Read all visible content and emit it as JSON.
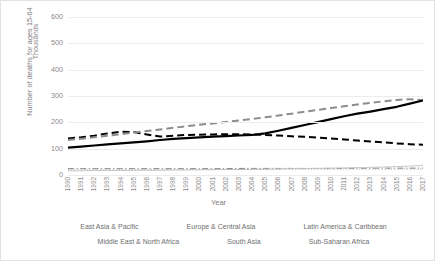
{
  "chart_data": {
    "type": "line",
    "title": "",
    "xlabel": "Year",
    "ylabel": "Number of deaths for ages 15-64",
    "yunit": "Thousands",
    "ylim": [
      0,
      600
    ],
    "yticks": [
      0,
      100,
      200,
      300,
      400,
      500,
      600
    ],
    "grid": true,
    "legend_position": "bottom",
    "x": [
      1990,
      1991,
      1992,
      1993,
      1994,
      1995,
      1996,
      1997,
      1998,
      1999,
      2000,
      2001,
      2002,
      2003,
      2004,
      2005,
      2006,
      2007,
      2008,
      2009,
      2010,
      2011,
      2012,
      2013,
      2014,
      2015,
      2016,
      2017
    ],
    "categories": [
      "1990",
      "1991",
      "1992",
      "1993",
      "1994",
      "1995",
      "1996",
      "1997",
      "1998",
      "1999",
      "2000",
      "2001",
      "2002",
      "2003",
      "2004",
      "2005",
      "2006",
      "2007",
      "2008",
      "2009",
      "2010",
      "2011",
      "2012",
      "2013",
      "2014",
      "2015",
      "2016",
      "2017"
    ],
    "series": [
      {
        "name": "East Asia & Pacific",
        "style": "dash-dot",
        "color": "#808080",
        "width": 1,
        "values": [
          24,
          24,
          24,
          24,
          24,
          24,
          24,
          24,
          24,
          24,
          24,
          24,
          24,
          25,
          25,
          25,
          25,
          25,
          25,
          25,
          25,
          25,
          26,
          26,
          26,
          26,
          26,
          26
        ]
      },
      {
        "name": "Europe & Central Asia",
        "style": "dashed",
        "color": "#000000",
        "width": 2,
        "values": [
          139,
          143,
          149,
          158,
          164,
          163,
          154,
          146,
          149,
          152,
          153,
          154,
          155,
          155,
          154,
          152,
          150,
          147,
          145,
          142,
          139,
          135,
          131,
          127,
          124,
          120,
          117,
          115
        ]
      },
      {
        "name": "Latin America & Caribbean",
        "style": "dashed",
        "color": "#8c8c8c",
        "width": 2,
        "values": [
          133,
          138,
          143,
          149,
          155,
          161,
          167,
          173,
          179,
          185,
          191,
          196,
          201,
          207,
          213,
          219,
          226,
          233,
          240,
          247,
          254,
          261,
          268,
          274,
          280,
          285,
          288,
          284
        ]
      },
      {
        "name": "Middle East & North Africa",
        "style": "solid",
        "color": "#c9c9c9",
        "width": 1,
        "values": [
          16,
          16,
          17,
          17,
          17,
          18,
          18,
          18,
          19,
          19,
          20,
          20,
          21,
          21,
          22,
          22,
          23,
          24,
          24,
          25,
          26,
          27,
          28,
          29,
          30,
          32,
          34,
          36
        ]
      },
      {
        "name": "South Asia",
        "style": "solid",
        "color": "#000000",
        "width": 2.2,
        "values": [
          104,
          108,
          112,
          116,
          120,
          124,
          128,
          133,
          137,
          140,
          143,
          146,
          148,
          150,
          152,
          158,
          168,
          179,
          190,
          201,
          212,
          223,
          233,
          241,
          250,
          259,
          271,
          283
        ]
      },
      {
        "name": "Sub-Saharan Africa",
        "style": "dotted",
        "color": "#a8a8a8",
        "width": 1,
        "values": [
          20,
          20,
          20,
          20,
          20,
          20,
          20,
          20,
          20,
          20,
          20,
          21,
          21,
          21,
          21,
          21,
          21,
          22,
          22,
          22,
          22,
          22,
          22,
          22,
          22,
          22,
          22,
          22
        ]
      }
    ]
  },
  "legend": {
    "rows": [
      [
        {
          "label": "East Asia & Pacific",
          "style": "dash-dot",
          "color": "#808080",
          "width": 1
        },
        {
          "label": "Europe & Central Asia",
          "style": "dashed",
          "color": "#000000",
          "width": 2
        },
        {
          "label": "Latin America & Caribbean",
          "style": "dashed",
          "color": "#8c8c8c",
          "width": 2
        }
      ],
      [
        {
          "label": "Middle East & North Africa",
          "style": "solid",
          "color": "#c9c9c9",
          "width": 1
        },
        {
          "label": "South Asia",
          "style": "solid",
          "color": "#000000",
          "width": 2.4
        },
        {
          "label": "Sub-Saharan Africa",
          "style": "dotted",
          "color": "#a8a8a8",
          "width": 1
        }
      ]
    ]
  }
}
